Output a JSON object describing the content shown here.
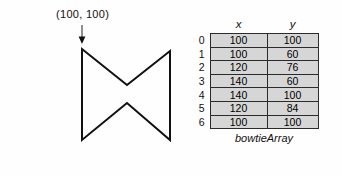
{
  "figure": {
    "annotation_label": "(100, 100)",
    "polygon_points": "82,49 82,140 127,103 170,140 170,51 127,85",
    "vertices": [
      {
        "x": 100,
        "y": 100
      },
      {
        "x": 100,
        "y": 60
      },
      {
        "x": 120,
        "y": 76
      },
      {
        "x": 140,
        "y": 60
      },
      {
        "x": 140,
        "y": 100
      },
      {
        "x": 120,
        "y": 84
      },
      {
        "x": 100,
        "y": 100
      }
    ]
  },
  "table": {
    "headers": {
      "x": "x",
      "y": "y"
    },
    "rows": [
      {
        "index": "0",
        "x": "100",
        "y": "100"
      },
      {
        "index": "1",
        "x": "100",
        "y": "60"
      },
      {
        "index": "2",
        "x": "120",
        "y": "76"
      },
      {
        "index": "3",
        "x": "140",
        "y": "60"
      },
      {
        "index": "4",
        "x": "140",
        "y": "100"
      },
      {
        "index": "5",
        "x": "120",
        "y": "84"
      },
      {
        "index": "6",
        "x": "100",
        "y": "100"
      }
    ],
    "caption": "bowtieArray"
  },
  "colors": {
    "background": "#fefefe",
    "cell_background": "#d6d6d6",
    "table_border": "#2b2b2b",
    "shape_stroke": "#111111",
    "text": "#000000"
  }
}
